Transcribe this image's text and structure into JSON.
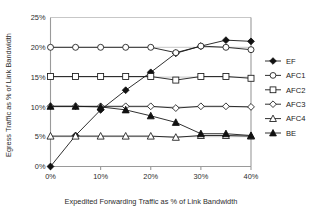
{
  "chart_data": {
    "type": "line",
    "title": "",
    "xlabel": "Expedited Forwarding Traffic as % of Link Bandwidth",
    "ylabel": "Egress Traffic as % of Link Bandwidth",
    "x": [
      0,
      5,
      10,
      15,
      20,
      25,
      30,
      35,
      40
    ],
    "xlim": [
      0,
      40
    ],
    "ylim": [
      0,
      25
    ],
    "xticks": [
      0,
      10,
      20,
      30,
      40
    ],
    "xtick_labels": [
      "0%",
      "10%",
      "20%",
      "30%",
      "40%"
    ],
    "yticks": [
      0,
      5,
      10,
      15,
      20,
      25
    ],
    "ytick_labels": [
      "0%",
      "5%",
      "10%",
      "15%",
      "20%",
      "25%"
    ],
    "grid": "horizontal",
    "legend_position": "right",
    "series": [
      {
        "name": "EF",
        "marker": "filled-diamond",
        "values": [
          0.0,
          5.2,
          9.5,
          12.8,
          15.8,
          19.0,
          20.2,
          21.2,
          21.0
        ]
      },
      {
        "name": "AFC1",
        "marker": "open-circle",
        "values": [
          20.0,
          20.0,
          20.0,
          20.0,
          20.0,
          19.1,
          20.2,
          20.0,
          19.6
        ]
      },
      {
        "name": "AFC2",
        "marker": "open-square",
        "values": [
          15.1,
          15.1,
          15.1,
          15.1,
          15.1,
          14.5,
          15.1,
          15.1,
          14.8
        ]
      },
      {
        "name": "AFC3",
        "marker": "open-diamond",
        "values": [
          10.1,
          10.1,
          10.1,
          10.1,
          10.1,
          9.8,
          10.1,
          10.1,
          10.0
        ]
      },
      {
        "name": "AFC4",
        "marker": "open-triangle",
        "values": [
          5.1,
          5.1,
          5.1,
          5.1,
          5.1,
          4.9,
          5.2,
          5.2,
          5.1
        ]
      },
      {
        "name": "BE",
        "marker": "filled-triangle",
        "values": [
          10.1,
          10.1,
          10.0,
          9.5,
          8.5,
          7.4,
          5.5,
          5.5,
          5.2
        ]
      }
    ]
  }
}
